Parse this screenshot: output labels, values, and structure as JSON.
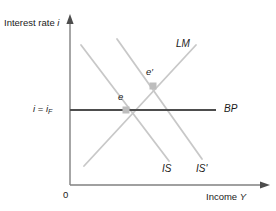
{
  "figure": {
    "type": "economics-diagram",
    "model": "IS-LM-BP",
    "background_color": "#ffffff"
  },
  "axes": {
    "y": {
      "label_prefix": "Interest rate ",
      "label_symbol": "i",
      "arrow": true,
      "color": "#808080"
    },
    "x": {
      "label_prefix": "Income ",
      "label_symbol": "Y",
      "arrow": true,
      "color": "#808080"
    },
    "origin_label": "0"
  },
  "ticks": {
    "y": [
      {
        "symbol_left": "i",
        "equals": " = ",
        "symbol_right": "i",
        "subscript": "F"
      }
    ]
  },
  "curves": [
    {
      "id": "lm",
      "label": "LM",
      "slope": "upward",
      "color": "#c8c8c8",
      "x1": 84,
      "y1": 166,
      "x2": 196,
      "y2": 45
    },
    {
      "id": "is",
      "label": "IS",
      "slope": "downward",
      "color": "#c8c8c8",
      "x1": 81,
      "y1": 45,
      "x2": 169,
      "y2": 161
    },
    {
      "id": "is-prime",
      "label": "IS'",
      "slope": "downward",
      "color": "#c8c8c8",
      "x1": 117,
      "y1": 39,
      "x2": 202,
      "y2": 159
    },
    {
      "id": "bp",
      "label": "BP",
      "slope": "horizontal",
      "color": "#4d4d4d",
      "x1": 70,
      "y1": 110,
      "x2": 216,
      "y2": 110
    }
  ],
  "points": [
    {
      "id": "e",
      "label": "e",
      "x": 126,
      "y": 110,
      "marker": "square",
      "marker_color": "#bdbdbd"
    },
    {
      "id": "e-prime",
      "label": "e′",
      "x": 153,
      "y": 86,
      "marker": "square",
      "marker_color": "#bdbdbd"
    }
  ],
  "chart_data": {
    "type": "line",
    "title": "",
    "xlabel": "Income Y",
    "ylabel": "Interest rate i",
    "annotations": [
      "e",
      "e′",
      "i = i_F"
    ],
    "legend_entries": [
      "LM",
      "IS",
      "IS'",
      "BP"
    ]
  }
}
